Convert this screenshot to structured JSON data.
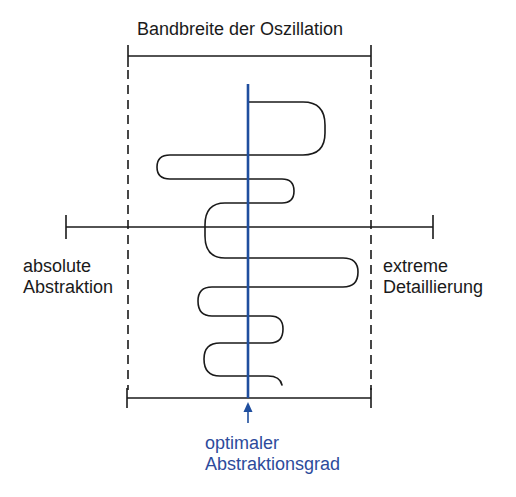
{
  "diagram": {
    "top_bracket_label": "Bandbreite der Oszillation",
    "left_label": {
      "line1": "absolute",
      "line2": "Abstraktion"
    },
    "right_label": {
      "line1": "extreme",
      "line2": "Detaillierung"
    },
    "bottom_label": {
      "line1": "optimaler",
      "line2": "Abstraktionsgrad"
    },
    "colors": {
      "line": "#1a1a1a",
      "optimum": "#1f4e9e",
      "optimum_text": "#2d4b9c",
      "background": "#ffffff"
    }
  }
}
